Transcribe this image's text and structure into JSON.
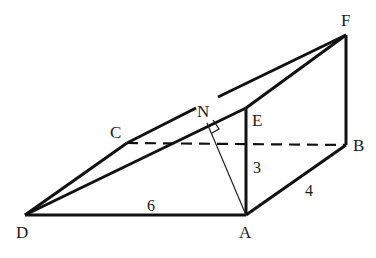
{
  "figure": {
    "type": "3d-wedge-geometry",
    "stroke_color": "#111111",
    "background": "#ffffff",
    "vertices": {
      "A": {
        "label": "A",
        "x": 246,
        "y": 215
      },
      "B": {
        "label": "B",
        "x": 346,
        "y": 145
      },
      "C": {
        "label": "C",
        "x": 127,
        "y": 143
      },
      "D": {
        "label": "D",
        "x": 25,
        "y": 215
      },
      "E": {
        "label": "E",
        "x": 246,
        "y": 108
      },
      "F": {
        "label": "F",
        "x": 346,
        "y": 35
      },
      "N": {
        "label": "N",
        "x": 207,
        "y": 123
      }
    },
    "edge_labels": {
      "DA": "6",
      "AE": "3",
      "AB": "4"
    },
    "solid_edges": [
      "DA",
      "AE",
      "AB",
      "BF",
      "EF",
      "DE",
      "DC",
      "CF"
    ],
    "hidden_edges": [
      "CB"
    ],
    "thin_edges": [
      "AN"
    ],
    "right_angle_at": "N"
  }
}
